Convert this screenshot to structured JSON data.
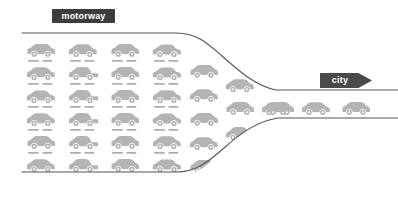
{
  "canvas": {
    "width": 398,
    "height": 199,
    "background": "#ffffff"
  },
  "labels": {
    "motorway": {
      "text": "motorway",
      "badge_color": "#3d3d3d",
      "text_color": "#ffffff",
      "shape": "rounded-rectangle"
    },
    "city": {
      "text": "city",
      "badge_color": "#4a4a4a",
      "text_color": "#ffffff",
      "shape": "right-pointing-arrow-banner"
    }
  },
  "colors": {
    "car_fill": "#b4b4b4",
    "car_fill_light": "#bdbdbd",
    "car_shadow": "#9a9a9a",
    "road_line": "#555555",
    "background": "#ffffff"
  },
  "roads": {
    "top_line": {
      "name": "upper-road-edge",
      "path": "M 22,33 L 176,33 C 196,33 206,42 222,56 C 240,72 256,86 276,90 L 398,90",
      "stroke": "#555555",
      "stroke_width": 1.1
    },
    "bottom_line": {
      "name": "lower-road-edge",
      "path": "M 22,172 L 176,172 C 196,172 208,162 224,148 C 242,132 258,121 278,118 L 398,118",
      "stroke": "#555555",
      "stroke_width": 1.1
    }
  },
  "traffic": {
    "description": "Congested multi-lane motorway traffic funneling into a narrow two-lane city road",
    "congested_block": {
      "rows": 6,
      "columns": 4,
      "total_cars": 24
    },
    "funnel_cars": 10,
    "open_road_cars": 4,
    "total_cars": 38
  },
  "cars": [
    {
      "id": "car-r1c1",
      "x": 25,
      "y": 41,
      "w": 32,
      "h": 17,
      "type": "suv",
      "shadow": true
    },
    {
      "id": "car-r1c2",
      "x": 67,
      "y": 41,
      "w": 32,
      "h": 17,
      "type": "hatchback",
      "shadow": true
    },
    {
      "id": "car-r1c3",
      "x": 109,
      "y": 41,
      "w": 32,
      "h": 17,
      "type": "suv",
      "shadow": true
    },
    {
      "id": "car-r1c4",
      "x": 151,
      "y": 41,
      "w": 32,
      "h": 17,
      "type": "sedan",
      "shadow": true
    },
    {
      "id": "car-r2c1",
      "x": 25,
      "y": 64,
      "w": 32,
      "h": 17,
      "type": "hatchback",
      "shadow": true
    },
    {
      "id": "car-r2c2",
      "x": 67,
      "y": 64,
      "w": 32,
      "h": 17,
      "type": "pickup",
      "shadow": true
    },
    {
      "id": "car-r2c3",
      "x": 109,
      "y": 64,
      "w": 32,
      "h": 17,
      "type": "suv",
      "shadow": true
    },
    {
      "id": "car-r2c4",
      "x": 151,
      "y": 64,
      "w": 32,
      "h": 17,
      "type": "sedan",
      "shadow": true
    },
    {
      "id": "car-r3c1",
      "x": 25,
      "y": 87,
      "w": 32,
      "h": 17,
      "type": "sedan",
      "shadow": true
    },
    {
      "id": "car-r3c2",
      "x": 67,
      "y": 87,
      "w": 32,
      "h": 17,
      "type": "pickup",
      "shadow": true
    },
    {
      "id": "car-r3c3",
      "x": 109,
      "y": 87,
      "w": 32,
      "h": 17,
      "type": "suv",
      "shadow": true
    },
    {
      "id": "car-r3c4",
      "x": 151,
      "y": 87,
      "w": 32,
      "h": 17,
      "type": "hatchback",
      "shadow": true
    },
    {
      "id": "car-r4c1",
      "x": 25,
      "y": 110,
      "w": 32,
      "h": 17,
      "type": "hatchback",
      "shadow": true
    },
    {
      "id": "car-r4c2",
      "x": 67,
      "y": 110,
      "w": 32,
      "h": 17,
      "type": "pickup",
      "shadow": true
    },
    {
      "id": "car-r4c3",
      "x": 109,
      "y": 110,
      "w": 32,
      "h": 17,
      "type": "suv",
      "shadow": true
    },
    {
      "id": "car-r4c4",
      "x": 151,
      "y": 110,
      "w": 32,
      "h": 17,
      "type": "sedan",
      "shadow": true
    },
    {
      "id": "car-r5c1",
      "x": 25,
      "y": 133,
      "w": 32,
      "h": 17,
      "type": "suv",
      "shadow": true
    },
    {
      "id": "car-r5c2",
      "x": 67,
      "y": 133,
      "w": 32,
      "h": 17,
      "type": "pickup",
      "shadow": true
    },
    {
      "id": "car-r5c3",
      "x": 109,
      "y": 133,
      "w": 32,
      "h": 17,
      "type": "suv",
      "shadow": true
    },
    {
      "id": "car-r5c4",
      "x": 151,
      "y": 133,
      "w": 32,
      "h": 17,
      "type": "hatchback",
      "shadow": true
    },
    {
      "id": "car-r6c1",
      "x": 25,
      "y": 156,
      "w": 32,
      "h": 17,
      "type": "hatchback",
      "shadow": false
    },
    {
      "id": "car-r6c2",
      "x": 67,
      "y": 156,
      "w": 32,
      "h": 17,
      "type": "pickup",
      "shadow": false
    },
    {
      "id": "car-r6c3",
      "x": 109,
      "y": 156,
      "w": 32,
      "h": 17,
      "type": "suv",
      "shadow": false
    },
    {
      "id": "car-r6c4",
      "x": 151,
      "y": 156,
      "w": 32,
      "h": 17,
      "type": "sedan",
      "shadow": false
    },
    {
      "id": "car-f1",
      "x": 188,
      "y": 62,
      "w": 32,
      "h": 17,
      "type": "suv",
      "shadow": false
    },
    {
      "id": "car-f2",
      "x": 188,
      "y": 86,
      "w": 32,
      "h": 17,
      "type": "hatchback",
      "shadow": false
    },
    {
      "id": "car-f3",
      "x": 188,
      "y": 110,
      "w": 32,
      "h": 17,
      "type": "suv",
      "shadow": false
    },
    {
      "id": "car-f4",
      "x": 188,
      "y": 134,
      "w": 32,
      "h": 17,
      "type": "hatchback",
      "shadow": false
    },
    {
      "id": "car-f5",
      "x": 188,
      "y": 157,
      "w": 32,
      "h": 17,
      "type": "suv",
      "shadow": false
    },
    {
      "id": "car-f6",
      "x": 224,
      "y": 76,
      "w": 32,
      "h": 17,
      "type": "hatchback",
      "shadow": false
    },
    {
      "id": "car-f7",
      "x": 224,
      "y": 99,
      "w": 32,
      "h": 17,
      "type": "suv",
      "shadow": false
    },
    {
      "id": "car-f8",
      "x": 224,
      "y": 124,
      "w": 32,
      "h": 17,
      "type": "pickup",
      "shadow": false
    },
    {
      "id": "car-f9",
      "x": 260,
      "y": 99,
      "w": 32,
      "h": 17,
      "type": "hatchback",
      "shadow": false
    },
    {
      "id": "car-o1",
      "x": 264,
      "y": 99,
      "w": 32,
      "h": 17,
      "type": "suv",
      "shadow": false
    },
    {
      "id": "car-o2",
      "x": 300,
      "y": 99,
      "w": 32,
      "h": 17,
      "type": "hatchback",
      "shadow": false
    },
    {
      "id": "car-o3",
      "x": 340,
      "y": 99,
      "w": 32,
      "h": 17,
      "type": "suv",
      "shadow": false
    }
  ]
}
